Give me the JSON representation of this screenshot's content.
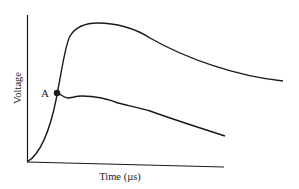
{
  "diagram": {
    "type": "voltage-time-curve",
    "axes": {
      "x_label": "Time (µs)",
      "y_label": "Voltage"
    },
    "curves": [
      {
        "name": "upper-curve",
        "description": "rises from origin through A to peak, then decays"
      },
      {
        "name": "lower-curve",
        "description": "branches at A, small dip, then gradual decay"
      }
    ],
    "point": {
      "label": "A"
    },
    "colors": {
      "line": "#1a1a1a",
      "background": "#ffffff"
    }
  }
}
